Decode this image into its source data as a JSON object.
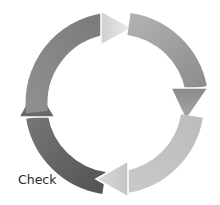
{
  "diagram": {
    "type": "cycle",
    "labels": [
      {
        "id": "check",
        "text": "Check",
        "x": 18,
        "y": 172
      }
    ],
    "segments": [
      {
        "id": "segment-top-left",
        "from": "left",
        "to": "top",
        "direction": "clockwise",
        "arc_color_start": "#8c8c8c",
        "arc_color_end": "#7a7a7a",
        "head_color": "#e0e0e0"
      },
      {
        "id": "segment-top-right",
        "from": "top",
        "to": "right",
        "direction": "clockwise",
        "arc_color_start": "#a8a8a8",
        "arc_color_end": "#909090",
        "head_color": "#9a9a9a"
      },
      {
        "id": "segment-bottom-right",
        "from": "right",
        "to": "bottom",
        "direction": "clockwise",
        "arc_color_start": "#c4c4c4",
        "arc_color_end": "#b4b4b4",
        "head_color": "#cfcfcf"
      },
      {
        "id": "segment-bottom-left",
        "from": "bottom",
        "to": "left",
        "direction": "clockwise",
        "arc_color_start": "#5e5e5e",
        "arc_color_end": "#6e6e6e",
        "head_color": "#777777"
      }
    ]
  }
}
